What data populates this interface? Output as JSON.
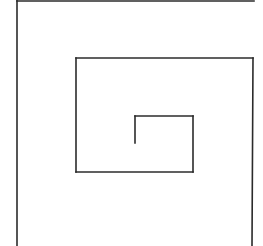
{
  "diagram": {
    "type": "spiral-maze",
    "width": 263,
    "height": 246,
    "background": "#ffffff",
    "stroke_color": "#2b2b2b",
    "stroke_width": 1.6,
    "segments": [
      {
        "id": "outer-left",
        "x1": 17,
        "y1": 0,
        "x2": 17,
        "y2": 246
      },
      {
        "id": "outer-top",
        "x1": 17,
        "y1": 1,
        "x2": 254,
        "y2": 1
      },
      {
        "id": "outer-right",
        "x1": 253,
        "y1": 58,
        "x2": 252,
        "y2": 246
      },
      {
        "id": "middle-top",
        "x1": 76,
        "y1": 58,
        "x2": 253,
        "y2": 58
      },
      {
        "id": "middle-left",
        "x1": 76,
        "y1": 58,
        "x2": 76,
        "y2": 172
      },
      {
        "id": "middle-bottom",
        "x1": 76,
        "y1": 172,
        "x2": 193,
        "y2": 172
      },
      {
        "id": "inner-right",
        "x1": 193,
        "y1": 116,
        "x2": 193,
        "y2": 172
      },
      {
        "id": "inner-top",
        "x1": 135,
        "y1": 116,
        "x2": 193,
        "y2": 116
      },
      {
        "id": "inner-left-stub",
        "x1": 135,
        "y1": 116,
        "x2": 135,
        "y2": 143
      }
    ]
  }
}
